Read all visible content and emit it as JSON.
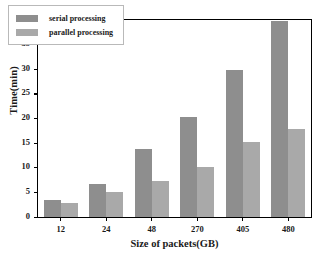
{
  "chart_data": {
    "type": "bar",
    "title": "",
    "xlabel": "Size of packets(GB)",
    "ylabel": "Time(min)",
    "categories": [
      "12",
      "24",
      "48",
      "270",
      "405",
      "480"
    ],
    "series": [
      {
        "name": "serial processing",
        "values": [
          3.5,
          6.8,
          13.9,
          20.3,
          29.8,
          39.8
        ],
        "color": "#8e8e8e"
      },
      {
        "name": "parallel processing",
        "values": [
          2.8,
          5.0,
          7.3,
          10.1,
          15.3,
          17.8
        ],
        "color": "#a9a9a9"
      }
    ],
    "ylim": [
      0,
      40
    ],
    "yticks": [
      "0",
      "5",
      "10",
      "15",
      "20",
      "25",
      "30",
      "35",
      "40"
    ],
    "ytick_values": [
      0,
      5,
      10,
      15,
      20,
      25,
      30,
      35,
      40
    ],
    "grid": false,
    "legend_position": "upper-left"
  },
  "legend": {
    "items": [
      {
        "label": "serial processing"
      },
      {
        "label": "parallel processing"
      }
    ]
  }
}
